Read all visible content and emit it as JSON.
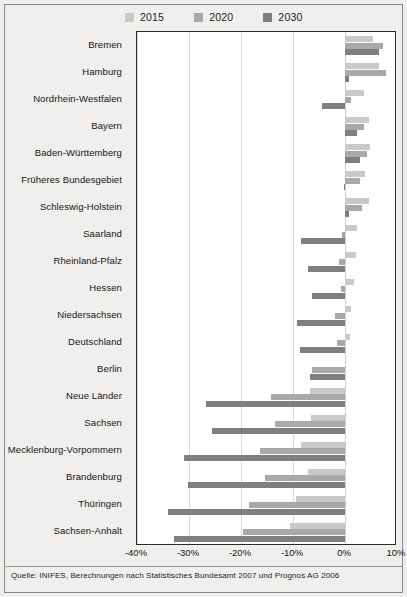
{
  "chart_data": {
    "type": "bar",
    "orientation": "horizontal",
    "title": "",
    "subtitle": "",
    "xlabel": "",
    "ylabel": "",
    "xlim": [
      -40,
      10
    ],
    "xticks": [
      -40,
      -30,
      -20,
      -10,
      0,
      10
    ],
    "xtick_labels": [
      "-40%",
      "-30%",
      "-20%",
      "-10%",
      "0%",
      "10%"
    ],
    "grid": true,
    "grid_axis": "x",
    "legend_position": "top",
    "categories": [
      "Bremen",
      "Hamburg",
      "Nordrhein-Westfalen",
      "Bayern",
      "Baden-Württemberg",
      "Früheres Bundesgebiet",
      "Schleswig-Holstein",
      "Saarland",
      "Rheinland-Pfalz",
      "Hessen",
      "Niedersachsen",
      "Deutschland",
      "Berlin",
      "Neue Länder",
      "Sachsen",
      "Mecklenburg-Vorpommern",
      "Brandenburg",
      "Thüringen",
      "Sachsen-Anhalt"
    ],
    "series": [
      {
        "name": "2015",
        "color": "#c9c9c9",
        "values": [
          5.4,
          6.6,
          3.6,
          4.6,
          4.8,
          3.8,
          4.6,
          2.4,
          2.2,
          1.8,
          1.2,
          1.0,
          0.0,
          -6.8,
          -6.6,
          -8.4,
          -7.2,
          -9.4,
          -10.6
        ]
      },
      {
        "name": "2020",
        "color": "#a9a9a9",
        "values": [
          7.4,
          7.8,
          1.2,
          3.6,
          4.2,
          2.8,
          3.2,
          -0.6,
          -1.2,
          -0.8,
          -2.0,
          -1.6,
          -6.4,
          -14.2,
          -13.4,
          -16.4,
          -15.4,
          -18.4,
          -19.6
        ]
      },
      {
        "name": "2030",
        "color": "#7f7f7f",
        "values": [
          6.6,
          0.8,
          -4.4,
          2.4,
          2.8,
          -0.2,
          0.8,
          -8.4,
          -7.2,
          -6.4,
          -9.2,
          -8.6,
          -6.8,
          -26.8,
          -25.6,
          -31.0,
          -30.2,
          -34.0,
          -32.8
        ]
      }
    ]
  },
  "legend": {
    "items": [
      {
        "label": "2015",
        "color": "#c9c9c9"
      },
      {
        "label": "2020",
        "color": "#a9a9a9"
      },
      {
        "label": "2030",
        "color": "#7f7f7f"
      }
    ]
  },
  "caption": {
    "text": "Quelle: INIFES, Berechnungen nach Statistisches Bundesamt 2007 und Prognos AG 2006"
  }
}
